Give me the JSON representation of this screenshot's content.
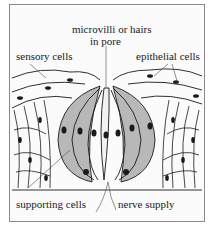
{
  "diagram": {
    "labels": {
      "top_center_line1": "microvilli or hairs",
      "top_center_line2": "in pore",
      "top_left": "sensory cells",
      "top_right": "epithelial cells",
      "bottom_left": "supporting cells",
      "bottom_right": "nerve supply"
    },
    "colors": {
      "line": "#1a1a1a",
      "shaded_cells": "#b8b8b8",
      "background": "#fbfbfb",
      "frame": "#8a8a8a"
    }
  }
}
